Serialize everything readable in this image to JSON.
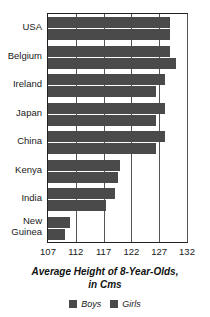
{
  "chart_data": {
    "type": "bar",
    "orientation": "horizontal",
    "title": "Average Height of 8-Year-Olds,",
    "title_line2": "in Cms",
    "xlabel": "",
    "ylabel": "",
    "xlim": [
      107,
      132
    ],
    "xticks": [
      107,
      112,
      117,
      122,
      127,
      132
    ],
    "grid": true,
    "grid_axis": "x",
    "legend_position": "bottom",
    "bar_color": "#4a4a4a",
    "categories": [
      "USA",
      "Belgium",
      "Ireland",
      "Japan",
      "China",
      "Kenya",
      "India",
      "New Guinea"
    ],
    "series": [
      {
        "name": "Boys",
        "values": [
          129.0,
          129.0,
          128.0,
          128.0,
          128.0,
          120.0,
          119.0,
          111.0
        ]
      },
      {
        "name": "Girls",
        "values": [
          129.0,
          130.0,
          126.5,
          126.5,
          126.5,
          119.5,
          117.5,
          110.0
        ]
      }
    ]
  },
  "axis_title": {
    "line1": "Average Height of 8-Year-Olds,",
    "line2": "in Cms"
  },
  "legend": {
    "items": [
      {
        "label": "Boys",
        "color": "#4a4a4a"
      },
      {
        "label": "Girls",
        "color": "#4a4a4a"
      }
    ]
  },
  "categories": [
    {
      "label": "USA"
    },
    {
      "label": "Belgium"
    },
    {
      "label": "Ireland"
    },
    {
      "label": "Japan"
    },
    {
      "label": "China"
    },
    {
      "label": "Kenya"
    },
    {
      "label": "India"
    },
    {
      "label": "New",
      "label2": "Guinea"
    }
  ],
  "xticks": [
    {
      "label": "107"
    },
    {
      "label": "112"
    },
    {
      "label": "117"
    },
    {
      "label": "122"
    },
    {
      "label": "127"
    },
    {
      "label": "132"
    }
  ]
}
